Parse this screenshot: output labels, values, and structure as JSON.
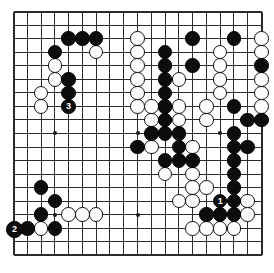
{
  "board": {
    "name": "go-board",
    "size": 19,
    "line_color": "#2b2b2b",
    "background_color": "#ffffff",
    "black_color": "#0c0c0c",
    "white_color": "#fdfdfd",
    "star_points": [
      [
        3,
        3
      ],
      [
        9,
        3
      ],
      [
        15,
        3
      ],
      [
        3,
        9
      ],
      [
        9,
        9
      ],
      [
        15,
        9
      ],
      [
        3,
        15
      ],
      [
        9,
        15
      ],
      [
        15,
        15
      ]
    ],
    "black_stones": [
      [
        4,
        2
      ],
      [
        5,
        2
      ],
      [
        6,
        2
      ],
      [
        13,
        2
      ],
      [
        16,
        2
      ],
      [
        3,
        3
      ],
      [
        11,
        3
      ],
      [
        11,
        4
      ],
      [
        13,
        4
      ],
      [
        18,
        4
      ],
      [
        4,
        5
      ],
      [
        11,
        5
      ],
      [
        4,
        6
      ],
      [
        11,
        6
      ],
      [
        4,
        7
      ],
      [
        11,
        7
      ],
      [
        16,
        7
      ],
      [
        11,
        8
      ],
      [
        17,
        8
      ],
      [
        18,
        8
      ],
      [
        10,
        9
      ],
      [
        11,
        9
      ],
      [
        12,
        9
      ],
      [
        16,
        9
      ],
      [
        9,
        10
      ],
      [
        12,
        10
      ],
      [
        16,
        10
      ],
      [
        17,
        10
      ],
      [
        11,
        11
      ],
      [
        12,
        11
      ],
      [
        13,
        11
      ],
      [
        16,
        11
      ],
      [
        16,
        12
      ],
      [
        2,
        13
      ],
      [
        16,
        13
      ],
      [
        3,
        14
      ],
      [
        15,
        14
      ],
      [
        16,
        14
      ],
      [
        2,
        15
      ],
      [
        14,
        15
      ],
      [
        15,
        15
      ],
      [
        16,
        15
      ],
      [
        1,
        16
      ],
      [
        3,
        16
      ]
    ],
    "white_stones": [
      [
        9,
        2
      ],
      [
        18,
        2
      ],
      [
        6,
        3
      ],
      [
        9,
        3
      ],
      [
        15,
        3
      ],
      [
        18,
        3
      ],
      [
        3,
        4
      ],
      [
        9,
        4
      ],
      [
        15,
        4
      ],
      [
        3,
        5
      ],
      [
        9,
        5
      ],
      [
        12,
        5
      ],
      [
        15,
        5
      ],
      [
        18,
        5
      ],
      [
        2,
        6
      ],
      [
        9,
        6
      ],
      [
        15,
        6
      ],
      [
        18,
        6
      ],
      [
        2,
        7
      ],
      [
        9,
        7
      ],
      [
        10,
        7
      ],
      [
        11,
        7
      ],
      [
        12,
        7
      ],
      [
        14,
        7
      ],
      [
        18,
        7
      ],
      [
        10,
        8
      ],
      [
        11,
        8
      ],
      [
        12,
        8
      ],
      [
        14,
        8
      ],
      [
        10,
        10
      ],
      [
        13,
        10
      ],
      [
        11,
        12
      ],
      [
        13,
        12
      ],
      [
        13,
        13
      ],
      [
        14,
        13
      ],
      [
        12,
        14
      ],
      [
        13,
        14
      ],
      [
        17,
        14
      ],
      [
        4,
        15
      ],
      [
        5,
        15
      ],
      [
        6,
        15
      ],
      [
        17,
        15
      ],
      [
        2,
        16
      ],
      [
        13,
        16
      ],
      [
        14,
        16
      ],
      [
        15,
        16
      ],
      [
        16,
        16
      ]
    ],
    "numbered_moves": [
      {
        "label": "1",
        "col": 15,
        "row": 14,
        "color": "black"
      },
      {
        "label": "2",
        "col": 0,
        "row": 16,
        "color": "black"
      },
      {
        "label": "3",
        "col": 4,
        "row": 7,
        "color": "black"
      }
    ]
  },
  "caption": {
    "title": "",
    "subtitle": ""
  }
}
